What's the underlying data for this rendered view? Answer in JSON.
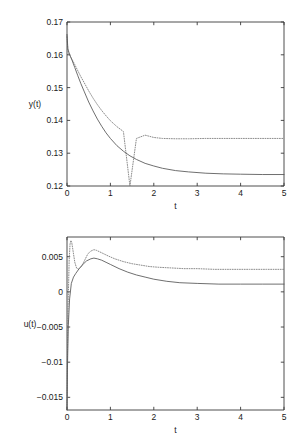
{
  "figure": {
    "background": "#ffffff",
    "axis_color": "#3a3a3a",
    "solid_color": "#555555",
    "dotted_color": "#777777"
  },
  "chart_data": [
    {
      "type": "line",
      "title": "",
      "xlabel": "t",
      "ylabel": "y(t)",
      "xlim": [
        0,
        5
      ],
      "ylim": [
        0.12,
        0.17
      ],
      "xticks": [
        0,
        1,
        2,
        3,
        4,
        5
      ],
      "xticklabels": [
        "0",
        "1",
        "2",
        "3",
        "4",
        "5"
      ],
      "yticks": [
        0.12,
        0.13,
        0.14,
        0.15,
        0.16,
        0.17
      ],
      "yticklabels": [
        "0.12",
        "0.13",
        "0.14",
        "0.15",
        "0.16",
        "0.17"
      ],
      "grid": false,
      "legend": "none",
      "series": [
        {
          "name": "y-solid",
          "style": "solid",
          "color": "#555555",
          "x": [
            0,
            0.02,
            0.05,
            0.08,
            0.12,
            0.18,
            0.25,
            0.32,
            0.4,
            0.5,
            0.6,
            0.7,
            0.8,
            0.9,
            1.0,
            1.15,
            1.3,
            1.45,
            1.6,
            1.8,
            2.0,
            2.2,
            2.5,
            2.8,
            3.2,
            3.6,
            4.0,
            4.5,
            5.0
          ],
          "y": [
            0.1662,
            0.1618,
            0.1605,
            0.1595,
            0.1582,
            0.1561,
            0.1536,
            0.1512,
            0.1487,
            0.1456,
            0.1429,
            0.1404,
            0.1382,
            0.1362,
            0.1345,
            0.1323,
            0.1306,
            0.1292,
            0.1281,
            0.1269,
            0.1261,
            0.1254,
            0.1247,
            0.1243,
            0.1239,
            0.1237,
            0.1236,
            0.1235,
            0.1235
          ]
        },
        {
          "name": "y-dotted",
          "style": "dotted",
          "color": "#777777",
          "x": [
            0,
            0.02,
            0.05,
            0.08,
            0.12,
            0.18,
            0.25,
            0.32,
            0.4,
            0.5,
            0.6,
            0.7,
            0.8,
            0.9,
            1.0,
            1.15,
            1.3,
            1.45,
            1.6,
            1.8,
            2.0,
            2.2,
            2.5,
            2.8,
            3.2,
            3.6,
            4.0,
            4.5,
            5.0
          ],
          "y": [
            0.1655,
            0.1612,
            0.1602,
            0.1594,
            0.1585,
            0.157,
            0.1551,
            0.1533,
            0.1514,
            0.149,
            0.1468,
            0.1448,
            0.143,
            0.1414,
            0.1399,
            0.1381,
            0.1366,
            0.001155,
            0.1345,
            0.1355,
            0.1348,
            0.1345,
            0.1344,
            0.1344,
            0.1345,
            0.1345,
            0.1345,
            0.1345,
            0.1345
          ]
        }
      ]
    },
    {
      "type": "line",
      "title": "",
      "xlabel": "t",
      "ylabel": "u(t)",
      "xlim": [
        0,
        5
      ],
      "ylim": [
        -0.0168,
        0.0078
      ],
      "xticks": [
        0,
        1,
        2,
        3,
        4,
        5
      ],
      "xticklabels": [
        "0",
        "1",
        "2",
        "3",
        "4",
        "5"
      ],
      "yticks": [
        -0.015,
        -0.01,
        -0.005,
        0,
        0.005
      ],
      "yticklabels": [
        "-0.015",
        "-0.01",
        "-0.005",
        "0",
        "0.005"
      ],
      "grid": false,
      "legend": "none",
      "series": [
        {
          "name": "u-solid",
          "style": "solid",
          "color": "#555555",
          "x": [
            0,
            0.01,
            0.03,
            0.06,
            0.1,
            0.15,
            0.2,
            0.28,
            0.35,
            0.45,
            0.55,
            0.62,
            0.7,
            0.8,
            0.9,
            1.0,
            1.2,
            1.4,
            1.6,
            1.8,
            2.0,
            2.3,
            2.6,
            3.0,
            3.5,
            4.0,
            4.5,
            5.0
          ],
          "y": [
            -0.0168,
            -0.011,
            -0.0048,
            -0.001,
            0.0012,
            0.0021,
            0.0026,
            0.0033,
            0.0038,
            0.0044,
            0.0047,
            0.0048,
            0.0047,
            0.0045,
            0.0042,
            0.0039,
            0.0033,
            0.0028,
            0.0024,
            0.0021,
            0.0018,
            0.0015,
            0.0013,
            0.0012,
            0.0011,
            0.0011,
            0.0011,
            0.0011
          ]
        },
        {
          "name": "u-dotted",
          "style": "dotted",
          "color": "#777777",
          "x": [
            0,
            0.01,
            0.025,
            0.05,
            0.07,
            0.09,
            0.11,
            0.14,
            0.18,
            0.22,
            0.27,
            0.33,
            0.4,
            0.48,
            0.55,
            0.62,
            0.68,
            0.75,
            0.85,
            0.95,
            1.1,
            1.3,
            1.5,
            1.7,
            1.9,
            2.1,
            2.4,
            2.7,
            3.0,
            3.4,
            3.8,
            4.2,
            4.6,
            5.0
          ],
          "y": [
            -0.0168,
            -0.0095,
            -0.002,
            0.0045,
            0.0068,
            0.0073,
            0.007,
            0.0058,
            0.0042,
            0.0034,
            0.0032,
            0.0036,
            0.0044,
            0.0054,
            0.0058,
            0.006,
            0.0059,
            0.0057,
            0.0054,
            0.0051,
            0.0047,
            0.0043,
            0.004,
            0.0038,
            0.0036,
            0.0035,
            0.0034,
            0.0033,
            0.0033,
            0.0032,
            0.0032,
            0.0032,
            0.0032,
            0.0032
          ]
        }
      ]
    }
  ]
}
